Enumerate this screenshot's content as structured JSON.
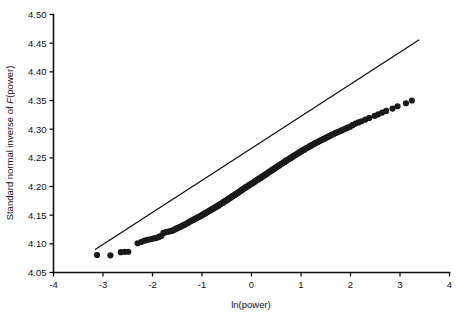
{
  "chart_data": {
    "type": "scatter",
    "title": "",
    "subtitle": "",
    "xlabel": "ln(power)",
    "ylabel_prefix": "Standard normal inverse of ",
    "ylabel_italic": "F",
    "ylabel_suffix": "(power)",
    "ylabel_full": "Standard normal inverse of F(power)",
    "xlim": [
      -4,
      4
    ],
    "ylim": [
      4.05,
      4.5
    ],
    "xticks": [
      -4,
      -3,
      -2,
      -1,
      0,
      1,
      2,
      3,
      4
    ],
    "xtick_labels": [
      "-4",
      "-3",
      "-2",
      "-1",
      "0",
      "1",
      "2",
      "3",
      "4"
    ],
    "yticks": [
      4.05,
      4.1,
      4.15,
      4.2,
      4.25,
      4.3,
      4.35,
      4.4,
      4.45,
      4.5
    ],
    "ytick_labels": [
      "4.05",
      "4.10",
      "4.15",
      "4.20",
      "4.25",
      "4.30",
      "4.35",
      "4.40",
      "4.45",
      "4.50"
    ],
    "grid": false,
    "legend": false,
    "legend_position": "none",
    "marker_color": "#1a1a1a",
    "marker_size": 3.1,
    "line_color": "#111111",
    "reference_line": {
      "label": "45-degree reference line",
      "x_start": -3.15,
      "y_start": 4.0905,
      "x_end": 3.38,
      "y_end": 4.4555
    },
    "series": [
      {
        "name": "power quantiles",
        "points": [
          [
            -3.12,
            4.0805
          ],
          [
            -2.85,
            4.08
          ],
          [
            -2.64,
            4.0855
          ],
          [
            -2.56,
            4.086
          ],
          [
            -2.49,
            4.0862
          ],
          [
            -2.3,
            4.101
          ],
          [
            -2.22,
            4.1035
          ],
          [
            -2.16,
            4.1055
          ],
          [
            -2.1,
            4.107
          ],
          [
            -2.04,
            4.108
          ],
          [
            -1.99,
            4.1092
          ],
          [
            -1.94,
            4.11
          ],
          [
            -1.9,
            4.111
          ],
          [
            -1.86,
            4.1125
          ],
          [
            -1.82,
            4.114
          ],
          [
            -1.78,
            4.119
          ],
          [
            -1.74,
            4.12
          ],
          [
            -1.7,
            4.121
          ],
          [
            -1.67,
            4.1215
          ],
          [
            -1.63,
            4.1222
          ],
          [
            -1.6,
            4.123
          ],
          [
            -1.57,
            4.124
          ],
          [
            -1.54,
            4.1255
          ],
          [
            -1.51,
            4.1268
          ],
          [
            -1.48,
            4.128
          ],
          [
            -1.45,
            4.1292
          ],
          [
            -1.42,
            4.1305
          ],
          [
            -1.39,
            4.1318
          ],
          [
            -1.36,
            4.133
          ],
          [
            -1.34,
            4.1342
          ],
          [
            -1.31,
            4.1355
          ],
          [
            -1.28,
            4.1368
          ],
          [
            -1.26,
            4.138
          ],
          [
            -1.23,
            4.1392
          ],
          [
            -1.21,
            4.1405
          ],
          [
            -1.18,
            4.1415
          ],
          [
            -1.16,
            4.1425
          ],
          [
            -1.14,
            4.1436
          ],
          [
            -1.11,
            4.1448
          ],
          [
            -1.09,
            4.1458
          ],
          [
            -1.07,
            4.1468
          ],
          [
            -1.05,
            4.1478
          ],
          [
            -1.02,
            4.149
          ],
          [
            -1.0,
            4.15
          ],
          [
            -0.98,
            4.151
          ],
          [
            -0.96,
            4.152
          ],
          [
            -0.94,
            4.153
          ],
          [
            -0.92,
            4.154
          ],
          [
            -0.9,
            4.155
          ],
          [
            -0.88,
            4.156
          ],
          [
            -0.86,
            4.1572
          ],
          [
            -0.84,
            4.1582
          ],
          [
            -0.82,
            4.1592
          ],
          [
            -0.8,
            4.1602
          ],
          [
            -0.78,
            4.1612
          ],
          [
            -0.76,
            4.1622
          ],
          [
            -0.74,
            4.1632
          ],
          [
            -0.72,
            4.1642
          ],
          [
            -0.7,
            4.1652
          ],
          [
            -0.68,
            4.1662
          ],
          [
            -0.67,
            4.1672
          ],
          [
            -0.65,
            4.1682
          ],
          [
            -0.63,
            4.1692
          ],
          [
            -0.61,
            4.1702
          ],
          [
            -0.59,
            4.1712
          ],
          [
            -0.57,
            4.1722
          ],
          [
            -0.56,
            4.1732
          ],
          [
            -0.54,
            4.1742
          ],
          [
            -0.52,
            4.1752
          ],
          [
            -0.5,
            4.1762
          ],
          [
            -0.48,
            4.1772
          ],
          [
            -0.47,
            4.1782
          ],
          [
            -0.45,
            4.1792
          ],
          [
            -0.43,
            4.1802
          ],
          [
            -0.41,
            4.1812
          ],
          [
            -0.4,
            4.1822
          ],
          [
            -0.38,
            4.1832
          ],
          [
            -0.36,
            4.1842
          ],
          [
            -0.34,
            4.1852
          ],
          [
            -0.33,
            4.1862
          ],
          [
            -0.31,
            4.1872
          ],
          [
            -0.29,
            4.1882
          ],
          [
            -0.27,
            4.1892
          ],
          [
            -0.26,
            4.1902
          ],
          [
            -0.24,
            4.1912
          ],
          [
            -0.22,
            4.1922
          ],
          [
            -0.2,
            4.1934
          ],
          [
            -0.19,
            4.1944
          ],
          [
            -0.17,
            4.1954
          ],
          [
            -0.15,
            4.1964
          ],
          [
            -0.13,
            4.1974
          ],
          [
            -0.12,
            4.1984
          ],
          [
            -0.1,
            4.1994
          ],
          [
            -0.08,
            4.2004
          ],
          [
            -0.06,
            4.2014
          ],
          [
            -0.05,
            4.2024
          ],
          [
            -0.03,
            4.2034
          ],
          [
            -0.01,
            4.2044
          ],
          [
            0.01,
            4.2054
          ],
          [
            0.03,
            4.2064
          ],
          [
            0.05,
            4.2074
          ],
          [
            0.06,
            4.2084
          ],
          [
            0.08,
            4.2094
          ],
          [
            0.1,
            4.2104
          ],
          [
            0.12,
            4.2114
          ],
          [
            0.13,
            4.2124
          ],
          [
            0.15,
            4.2134
          ],
          [
            0.17,
            4.2144
          ],
          [
            0.19,
            4.2154
          ],
          [
            0.2,
            4.2164
          ],
          [
            0.22,
            4.2174
          ],
          [
            0.24,
            4.2184
          ],
          [
            0.26,
            4.2194
          ],
          [
            0.27,
            4.2204
          ],
          [
            0.29,
            4.2214
          ],
          [
            0.31,
            4.2224
          ],
          [
            0.33,
            4.2234
          ],
          [
            0.34,
            4.2244
          ],
          [
            0.36,
            4.2254
          ],
          [
            0.38,
            4.2264
          ],
          [
            0.4,
            4.2274
          ],
          [
            0.41,
            4.2284
          ],
          [
            0.43,
            4.2294
          ],
          [
            0.45,
            4.2304
          ],
          [
            0.47,
            4.2314
          ],
          [
            0.48,
            4.2324
          ],
          [
            0.5,
            4.2334
          ],
          [
            0.52,
            4.2346
          ],
          [
            0.54,
            4.2356
          ],
          [
            0.56,
            4.2366
          ],
          [
            0.57,
            4.2376
          ],
          [
            0.59,
            4.2386
          ],
          [
            0.61,
            4.2396
          ],
          [
            0.63,
            4.2408
          ],
          [
            0.65,
            4.2418
          ],
          [
            0.67,
            4.2428
          ],
          [
            0.68,
            4.2438
          ],
          [
            0.7,
            4.245
          ],
          [
            0.72,
            4.246
          ],
          [
            0.74,
            4.247
          ],
          [
            0.76,
            4.2482
          ],
          [
            0.78,
            4.2492
          ],
          [
            0.8,
            4.2502
          ],
          [
            0.82,
            4.2514
          ],
          [
            0.84,
            4.2524
          ],
          [
            0.86,
            4.2536
          ],
          [
            0.88,
            4.2546
          ],
          [
            0.9,
            4.2558
          ],
          [
            0.92,
            4.2568
          ],
          [
            0.94,
            4.258
          ],
          [
            0.96,
            4.259
          ],
          [
            0.98,
            4.2602
          ],
          [
            1.0,
            4.2612
          ],
          [
            1.02,
            4.2624
          ],
          [
            1.05,
            4.2636
          ],
          [
            1.07,
            4.2646
          ],
          [
            1.09,
            4.2658
          ],
          [
            1.11,
            4.267
          ],
          [
            1.14,
            4.268
          ],
          [
            1.16,
            4.2692
          ],
          [
            1.18,
            4.2704
          ],
          [
            1.21,
            4.2716
          ],
          [
            1.23,
            4.2728
          ],
          [
            1.26,
            4.274
          ],
          [
            1.28,
            4.2752
          ],
          [
            1.31,
            4.2764
          ],
          [
            1.34,
            4.2776
          ],
          [
            1.36,
            4.2788
          ],
          [
            1.39,
            4.28
          ],
          [
            1.42,
            4.2814
          ],
          [
            1.45,
            4.2826
          ],
          [
            1.48,
            4.2838
          ],
          [
            1.51,
            4.2852
          ],
          [
            1.54,
            4.2864
          ],
          [
            1.57,
            4.2878
          ],
          [
            1.6,
            4.2892
          ],
          [
            1.63,
            4.2906
          ],
          [
            1.67,
            4.292
          ],
          [
            1.7,
            4.2934
          ],
          [
            1.74,
            4.2948
          ],
          [
            1.78,
            4.2964
          ],
          [
            1.82,
            4.2978
          ],
          [
            1.86,
            4.2994
          ],
          [
            1.9,
            4.301
          ],
          [
            1.94,
            4.3026
          ],
          [
            1.99,
            4.3042
          ],
          [
            2.04,
            4.307
          ],
          [
            2.1,
            4.3098
          ],
          [
            2.16,
            4.3118
          ],
          [
            2.22,
            4.3138
          ],
          [
            2.3,
            4.3168
          ],
          [
            2.38,
            4.3196
          ],
          [
            2.49,
            4.3232
          ],
          [
            2.56,
            4.3258
          ],
          [
            2.64,
            4.329
          ],
          [
            2.72,
            4.3318
          ],
          [
            2.85,
            4.336
          ],
          [
            2.95,
            4.34
          ],
          [
            3.12,
            4.3452
          ],
          [
            3.24,
            4.35
          ]
        ]
      }
    ]
  }
}
